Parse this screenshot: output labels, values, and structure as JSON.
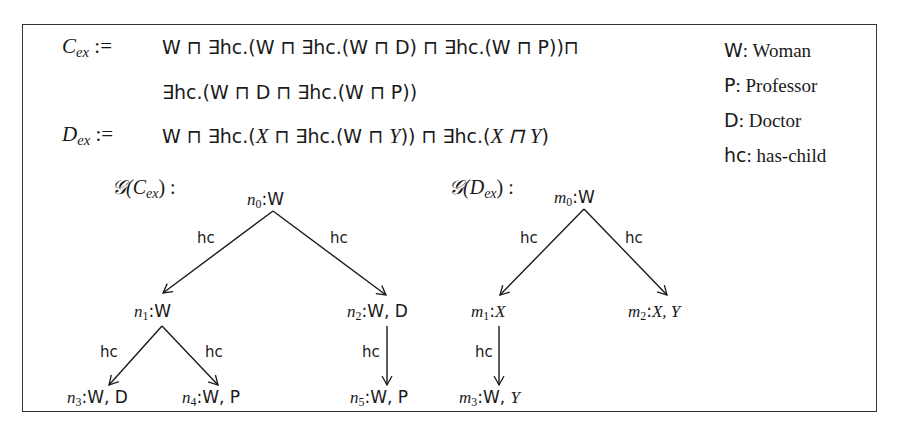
{
  "definitions": {
    "c_ex": {
      "lhs_symbol": "C",
      "lhs_sub": "ex",
      "assign": ":=",
      "line1": "W ⊓ ∃hc.(W ⊓ ∃hc.(W ⊓ D) ⊓ ∃hc.(W ⊓ P))⊓",
      "line2": "∃hc.(W ⊓ D ⊓ ∃hc.(W ⊓ P))"
    },
    "d_ex": {
      "lhs_symbol": "D",
      "lhs_sub": "ex",
      "assign": ":=",
      "line1_a": "W ⊓ ∃hc.(",
      "line1_b": "X",
      "line1_c": " ⊓ ∃hc.(W ⊓ ",
      "line1_d": "Y",
      "line1_e": ")) ⊓ ∃hc.(",
      "line1_f": "X ⊓ Y",
      "line1_g": ")"
    }
  },
  "legend": [
    {
      "key": "W",
      "sep": ": ",
      "value": "Woman"
    },
    {
      "key": "P",
      "sep": ": ",
      "value": "Professor"
    },
    {
      "key": "D",
      "sep": ": ",
      "value": "Doctor"
    },
    {
      "key": "hc",
      "sep": ": ",
      "value": "has-child"
    }
  ],
  "graph_c": {
    "label_prefix": "𝒢(",
    "label_symbol": "C",
    "label_sub": "ex",
    "label_suffix": ") :",
    "nodes": [
      {
        "id": "n",
        "sub": "0",
        "labels": "W"
      },
      {
        "id": "n",
        "sub": "1",
        "labels": "W"
      },
      {
        "id": "n",
        "sub": "2",
        "labels": "W, D"
      },
      {
        "id": "n",
        "sub": "3",
        "labels": "W, D"
      },
      {
        "id": "n",
        "sub": "4",
        "labels": "W, P"
      },
      {
        "id": "n",
        "sub": "5",
        "labels": "W, P"
      }
    ],
    "edges": [
      {
        "from": "n0",
        "to": "n1",
        "label": "hc"
      },
      {
        "from": "n0",
        "to": "n2",
        "label": "hc"
      },
      {
        "from": "n1",
        "to": "n3",
        "label": "hc"
      },
      {
        "from": "n1",
        "to": "n4",
        "label": "hc"
      },
      {
        "from": "n2",
        "to": "n5",
        "label": "hc"
      }
    ]
  },
  "graph_d": {
    "label_prefix": "𝒢(",
    "label_symbol": "D",
    "label_sub": "ex",
    "label_suffix": ") :",
    "nodes": [
      {
        "id": "m",
        "sub": "0",
        "labels_plain": "W",
        "labels_italic": ""
      },
      {
        "id": "m",
        "sub": "1",
        "labels_plain": "",
        "labels_italic": "X"
      },
      {
        "id": "m",
        "sub": "2",
        "labels_plain": "",
        "labels_italic": "X, Y"
      },
      {
        "id": "m",
        "sub": "3",
        "labels_plain": "W, ",
        "labels_italic": "Y"
      }
    ],
    "edges": [
      {
        "from": "m0",
        "to": "m1",
        "label": "hc"
      },
      {
        "from": "m0",
        "to": "m2",
        "label": "hc"
      },
      {
        "from": "m1",
        "to": "m3",
        "label": "hc"
      }
    ]
  },
  "colors": {
    "ink": "#1a1a1a",
    "frame": "#333333",
    "background": "#ffffff"
  }
}
